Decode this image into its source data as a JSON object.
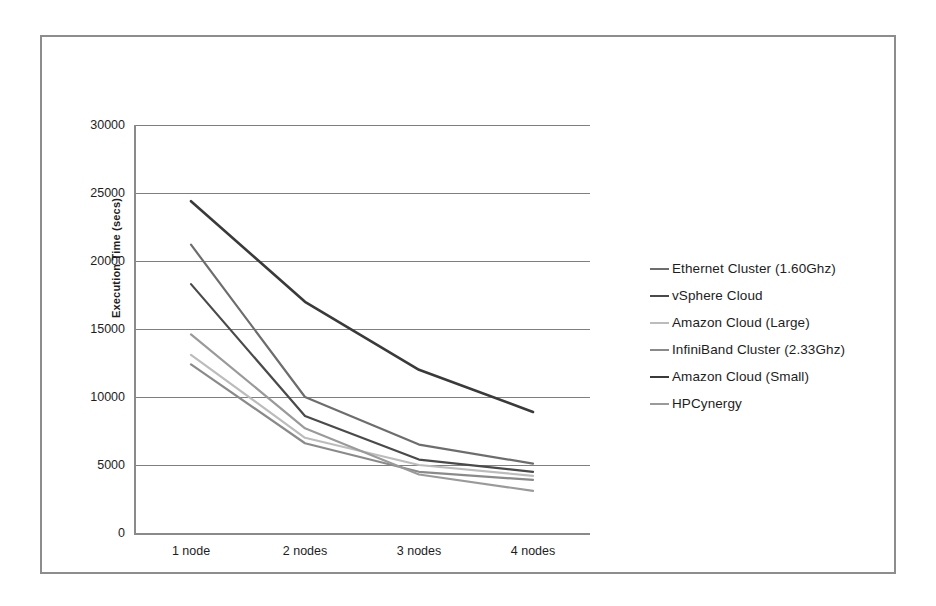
{
  "chart_data": {
    "type": "line",
    "title": "",
    "subtitle": "",
    "xlabel": "",
    "ylabel": "Execution Time (secs)",
    "categories": [
      "1 node",
      "2 nodes",
      "3 nodes",
      "4 nodes"
    ],
    "ylim": [
      0,
      30000
    ],
    "ytick_labels": [
      "30000",
      "25000",
      "20000",
      "15000",
      "10000",
      "5000",
      "0"
    ],
    "ytick_values": [
      30000,
      25000,
      20000,
      15000,
      10000,
      5000,
      0
    ],
    "grid": "horizontal",
    "legend_position": "right",
    "series": [
      {
        "name": "Ethernet Cluster (1.60Ghz)",
        "color": "#6d6d6d",
        "width": 2.2,
        "values": [
          21200,
          10000,
          6500,
          5100
        ]
      },
      {
        "name": "vSphere Cloud",
        "color": "#4a4a4a",
        "width": 2.2,
        "values": [
          18300,
          8600,
          5400,
          4500
        ]
      },
      {
        "name": "Amazon Cloud (Large)",
        "color": "#bcbcbc",
        "width": 2.2,
        "values": [
          13100,
          7000,
          5000,
          4200
        ]
      },
      {
        "name": "InfiniBand Cluster (2.33Ghz)",
        "color": "#8a8a8a",
        "width": 2.2,
        "values": [
          12400,
          6600,
          4500,
          3900
        ]
      },
      {
        "name": "Amazon Cloud  (Small)",
        "color": "#3a3a3a",
        "width": 2.6,
        "values": [
          24400,
          17000,
          12000,
          8900
        ]
      },
      {
        "name": "HPCynergy",
        "color": "#9a9a9a",
        "width": 2.2,
        "values": [
          14600,
          7700,
          4300,
          3100
        ]
      }
    ]
  },
  "legend": {
    "items": [
      {
        "label": "Ethernet Cluster (1.60Ghz)",
        "color": "#6d6d6d",
        "width": 2.2
      },
      {
        "label": "vSphere Cloud",
        "color": "#4a4a4a",
        "width": 2.6
      },
      {
        "label": "Amazon Cloud (Large)",
        "color": "#bcbcbc",
        "width": 2.2
      },
      {
        "label": "InfiniBand Cluster (2.33Ghz)",
        "color": "#8a8a8a",
        "width": 2.2
      },
      {
        "label": "Amazon Cloud  (Small)",
        "color": "#3a3a3a",
        "width": 2.8
      },
      {
        "label": "HPCynergy",
        "color": "#9a9a9a",
        "width": 2.2
      }
    ]
  },
  "style": {
    "frame_border_color": "#8d8d8d",
    "gridline_color": "#7f7f7f",
    "axis_color": "#8a8a8a",
    "text_color": "#1d1d1d",
    "background": "#ffffff"
  }
}
